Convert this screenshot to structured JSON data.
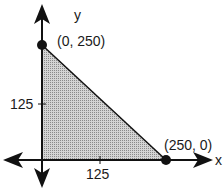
{
  "diagram": {
    "type": "feasible-region-plot",
    "axes": {
      "x_label": "x",
      "y_label": "y",
      "x_tick": "125",
      "y_tick": "125"
    },
    "points": [
      {
        "label": "(0, 250)",
        "x": 0,
        "y": 250
      },
      {
        "label": "(250, 0)",
        "x": 250,
        "y": 0
      }
    ],
    "region": {
      "vertices": [
        [
          0,
          0
        ],
        [
          0,
          250
        ],
        [
          250,
          0
        ]
      ],
      "fill": "#b0b0b0"
    },
    "colors": {
      "ink": "#111111",
      "shade": "#b0b0b0"
    }
  }
}
